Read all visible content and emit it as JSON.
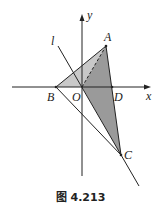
{
  "figure": {
    "caption": "图 4.213",
    "axes": {
      "x_label": "x",
      "y_label": "y"
    },
    "points": {
      "A": {
        "label": "A"
      },
      "B": {
        "label": "B"
      },
      "C": {
        "label": "C"
      },
      "D": {
        "label": "D"
      },
      "O": {
        "label": "O"
      }
    },
    "line_label": "l",
    "colors": {
      "light_fill": "#c8c8c8",
      "dark_fill": "#9a9a9a",
      "stroke": "#222222"
    }
  }
}
